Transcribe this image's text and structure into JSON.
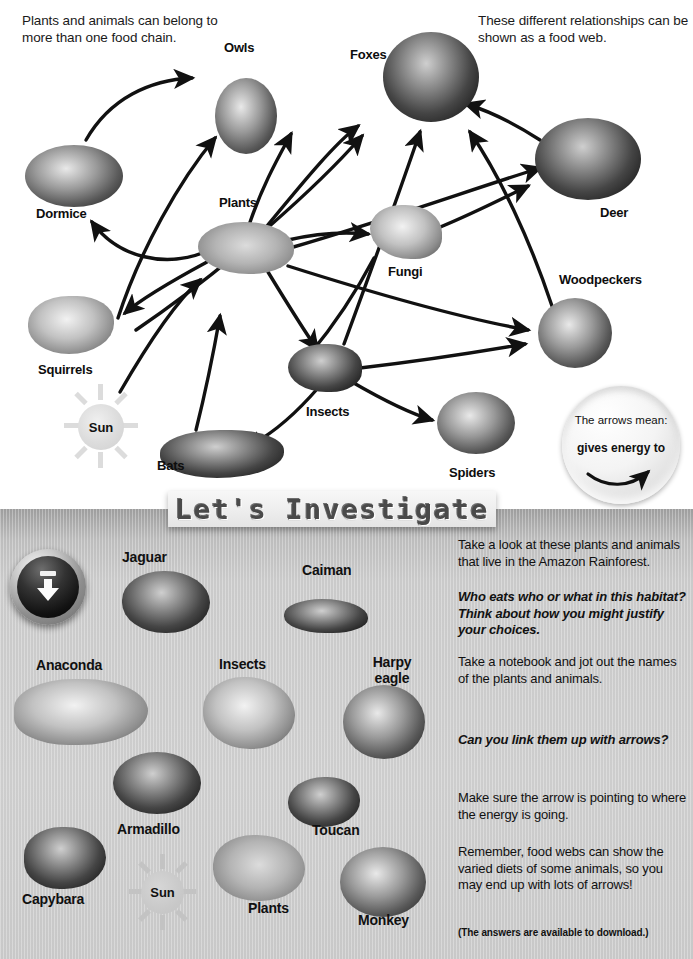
{
  "foodweb": {
    "intro_left": "Plants and animals can belong to more than one food chain.",
    "intro_right": "These different relationships can be shown as a food web.",
    "nodes": [
      {
        "id": "owls",
        "label": "Owls"
      },
      {
        "id": "foxes",
        "label": "Foxes"
      },
      {
        "id": "dormice",
        "label": "Dormice"
      },
      {
        "id": "plants",
        "label": "Plants"
      },
      {
        "id": "fungi",
        "label": "Fungi"
      },
      {
        "id": "deer",
        "label": "Deer"
      },
      {
        "id": "woodpeckers",
        "label": "Woodpeckers"
      },
      {
        "id": "squirrels",
        "label": "Squirrels"
      },
      {
        "id": "sun",
        "label": "Sun"
      },
      {
        "id": "insects",
        "label": "Insects"
      },
      {
        "id": "bats",
        "label": "Bats"
      },
      {
        "id": "spiders",
        "label": "Spiders"
      }
    ],
    "legend": {
      "line1": "The arrows mean:",
      "line2": "gives energy to"
    }
  },
  "banner": {
    "title": "Let's Investigate"
  },
  "panel": {
    "download_icon": "download-arrow-icon",
    "gallery": [
      {
        "id": "jaguar",
        "label": "Jaguar"
      },
      {
        "id": "caiman",
        "label": "Caiman"
      },
      {
        "id": "anaconda",
        "label": "Anaconda"
      },
      {
        "id": "insects",
        "label": "Insects"
      },
      {
        "id": "harpy-eagle",
        "label": "Harpy eagle"
      },
      {
        "id": "armadillo",
        "label": "Armadillo"
      },
      {
        "id": "toucan",
        "label": "Toucan"
      },
      {
        "id": "capybara",
        "label": "Capybara"
      },
      {
        "id": "sun",
        "label": "Sun"
      },
      {
        "id": "plants",
        "label": "Plants"
      },
      {
        "id": "monkey",
        "label": "Monkey"
      }
    ],
    "instructions": {
      "p1": "Take a look at these plants and animals that live in the Amazon Rainforest.",
      "p2": "Who eats who or what in this habitat? Think about how you might justify your choices.",
      "p3": "Take a notebook and jot out the names of the plants and animals.",
      "p4": "Can you link them up with arrows?",
      "p5": "Make sure the arrow is pointing to where the energy is going.",
      "p6": "Remember, food webs can show the varied diets of some animals, so you may end up with lots of arrows!",
      "note": "(The answers are available to download.)"
    }
  },
  "colors": {
    "page_bg": "#ffffff",
    "panel_bg": "#cccccc",
    "ink": "#111111",
    "banner_text": "#4a4a4a",
    "sun": "#dcdcdc"
  }
}
